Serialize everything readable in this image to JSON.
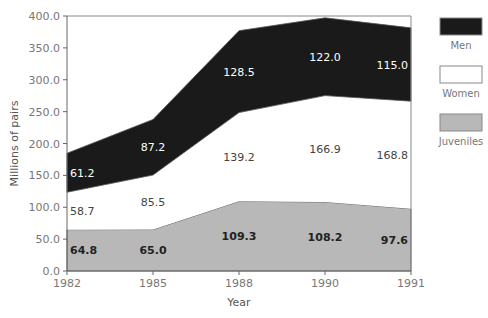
{
  "chart_data": {
    "type": "area",
    "stacked": true,
    "title": "",
    "xlabel": "Year",
    "ylabel": "Millions of pairs",
    "categories": [
      "1982",
      "1985",
      "1988",
      "1990",
      "1991"
    ],
    "ylim": [
      0,
      400
    ],
    "yticks": [
      "0.0",
      "50.0",
      "100.0",
      "150.0",
      "200.0",
      "250.0",
      "300.0",
      "350.0",
      "400.0"
    ],
    "series": [
      {
        "name": "Juveniles",
        "values": [
          64.8,
          65.0,
          109.3,
          108.2,
          97.6
        ],
        "color": "#b8b8b8",
        "labels": [
          "64.8",
          "65.0",
          "109.3",
          "108.2",
          "97.6"
        ]
      },
      {
        "name": "Women",
        "values": [
          58.7,
          85.5,
          139.2,
          166.9,
          168.8
        ],
        "color": "#ffffff",
        "labels": [
          "58.7",
          "85.5",
          "139.2",
          "166.9",
          "168.8"
        ]
      },
      {
        "name": "Men",
        "values": [
          61.2,
          87.2,
          128.5,
          122.0,
          115.0
        ],
        "color": "#1a1a1a",
        "labels": [
          "61.2",
          "87.2",
          "128.5",
          "122.0",
          "115.0"
        ]
      }
    ],
    "legend": [
      "Men",
      "Women",
      "Juveniles"
    ],
    "legend_position": "right",
    "grid": false
  }
}
